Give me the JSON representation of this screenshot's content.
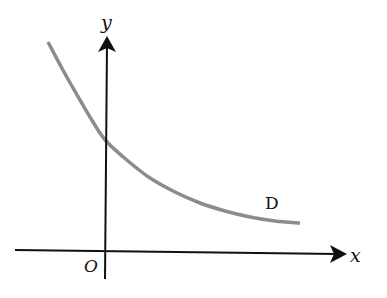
{
  "diagram": {
    "type": "coordinate-graph",
    "axes": {
      "x_label": "x",
      "y_label": "y",
      "origin_label": "O",
      "axis_color": "#111111"
    },
    "curve": {
      "label": "D",
      "color": "#8c8c8c",
      "description": "decreasing convex curve crossing positive y-axis, approaching a horizontal asymptote above the x-axis",
      "points": [
        [
          48,
          42
        ],
        [
          64,
          72
        ],
        [
          80,
          100
        ],
        [
          93,
          122
        ],
        [
          106,
          141
        ],
        [
          128,
          161
        ],
        [
          150,
          178
        ],
        [
          175,
          192
        ],
        [
          200,
          203
        ],
        [
          225,
          211
        ],
        [
          250,
          217
        ],
        [
          275,
          221
        ],
        [
          300,
          223
        ]
      ]
    }
  }
}
